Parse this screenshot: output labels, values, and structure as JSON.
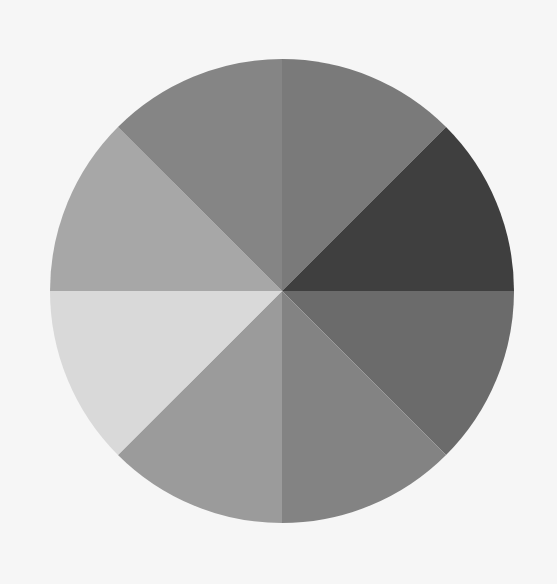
{
  "background": "#f6f6f6",
  "wheel": {
    "center": [
      282,
      291
    ],
    "radius": 232,
    "segment_count": 8,
    "segments": [
      {
        "name": "segment-1",
        "start_deg": 0,
        "end_deg": 45,
        "color": "#7a7a7a"
      },
      {
        "name": "segment-2",
        "start_deg": 45,
        "end_deg": 90,
        "color": "#3f3f3f"
      },
      {
        "name": "segment-3",
        "start_deg": 90,
        "end_deg": 135,
        "color": "#6b6b6b"
      },
      {
        "name": "segment-4",
        "start_deg": 135,
        "end_deg": 180,
        "color": "#838383"
      },
      {
        "name": "segment-5",
        "start_deg": 180,
        "end_deg": 225,
        "color": "#9b9b9b"
      },
      {
        "name": "segment-6",
        "start_deg": 225,
        "end_deg": 270,
        "color": "#d9d9d9"
      },
      {
        "name": "segment-7",
        "start_deg": 270,
        "end_deg": 315,
        "color": "#a7a7a7"
      },
      {
        "name": "segment-8",
        "start_deg": 315,
        "end_deg": 360,
        "color": "#858585"
      }
    ]
  }
}
